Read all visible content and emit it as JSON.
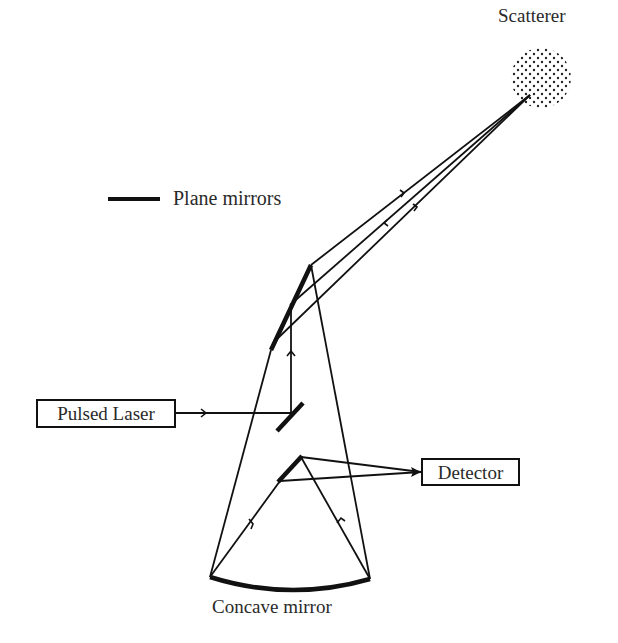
{
  "diagram": {
    "labels": {
      "scatterer": "Scatterer",
      "legend_plane_mirrors": "Plane mirrors",
      "pulsed_laser": "Pulsed Laser",
      "detector": "Detector",
      "concave_mirror": "Concave mirror"
    },
    "components": [
      {
        "id": "scatterer",
        "type": "dotted-circle",
        "center": [
          541,
          78
        ],
        "radius": 30
      },
      {
        "id": "pulsed-laser",
        "type": "box",
        "label": "Pulsed Laser"
      },
      {
        "id": "detector",
        "type": "box",
        "label": "Detector"
      },
      {
        "id": "plane-mirror-upper",
        "type": "plane-mirror",
        "from": [
          271,
          350
        ],
        "to": [
          311,
          265
        ]
      },
      {
        "id": "plane-mirror-laser",
        "type": "plane-mirror",
        "from": [
          277,
          431
        ],
        "to": [
          303,
          403
        ]
      },
      {
        "id": "plane-mirror-lower",
        "type": "plane-mirror",
        "from": [
          278,
          482
        ],
        "to": [
          302,
          456
        ]
      },
      {
        "id": "concave-mirror",
        "type": "concave-mirror",
        "from": [
          210,
          577
        ],
        "to": [
          370,
          579
        ]
      }
    ],
    "legend": [
      {
        "symbol": "thick-line",
        "label": "Plane mirrors"
      }
    ],
    "colors": {
      "line": "#111111",
      "text": "#2a2a2a",
      "background": "#ffffff"
    }
  }
}
